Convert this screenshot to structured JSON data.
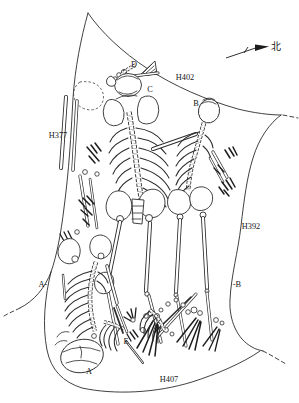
{
  "figure": {
    "background_color": "#ffffff",
    "ink_color": "#2b2b2b"
  },
  "compass": {
    "label": "北"
  },
  "pit_labels": {
    "h402": "H402",
    "h377": "H377",
    "h392": "H392",
    "h407": "H407"
  },
  "individual_labels": {
    "a": "A",
    "b": "B",
    "c": "C",
    "d": "D",
    "e": "E"
  },
  "section_markers": {
    "left": "A-",
    "right": "-B"
  }
}
